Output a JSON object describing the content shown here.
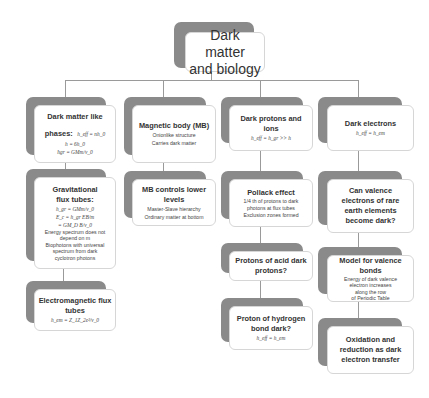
{
  "root": {
    "title_line1": "Dark matter",
    "title_line2": "and biology"
  },
  "columns": [
    {
      "nodes": [
        {
          "title": "Dark matter like",
          "title2": "phases:",
          "formula_inline": "h_eff = nh_0",
          "lines": [
            "h = 6h_0",
            "ħgr = GMm/v_0"
          ]
        },
        {
          "title": "Gravitational",
          "title2": "flux tubes:",
          "formulas": [
            "h_gr = GMm/v_0",
            "E_c = h_gr EB/m",
            "= GM_D B/v_0"
          ],
          "lines": [
            "Energy spectrum does not",
            "depend on m",
            "Biophotons with universal",
            "spectrum from dark",
            "cyclotron photons"
          ]
        },
        {
          "title": "Electromagnetic flux",
          "title2": "tubes",
          "formula": "h_em = Z_1Z_2e²/v_0"
        }
      ]
    },
    {
      "nodes": [
        {
          "title": "Magnetic body (MB)",
          "lines": [
            "Onionlike structure",
            "Carries dark matter"
          ]
        },
        {
          "title": "MB controls lower",
          "title2": "levels",
          "lines": [
            "Master-Slave hierarchy",
            "Ordinary matter at bottom"
          ]
        }
      ]
    },
    {
      "nodes": [
        {
          "title": "Dark protons and",
          "title2": "ions",
          "formula": "h_eff = h_gr >> h"
        },
        {
          "title": "Pollack effect",
          "lines": [
            "1/4 th of protons to dark",
            "photons at flux tubes",
            "Exclusion zones formed"
          ]
        },
        {
          "title": "Protons of acid dark",
          "title2": "protons?"
        },
        {
          "title": "Proton of hydrogen",
          "title2": "bond dark?",
          "formula": "h_eff = h_em"
        }
      ]
    },
    {
      "nodes": [
        {
          "title": "Dark electrons",
          "formula": "h_eff = h_em"
        },
        {
          "title": "Can valence",
          "title2": "electrons of rare",
          "title3": "earth elements",
          "title4": "become dark?"
        },
        {
          "title": "Model for valence",
          "title2": "bonds",
          "lines": [
            "Energy of dark valence",
            "electron increases",
            "along the row",
            "of Periodic Table"
          ]
        },
        {
          "title": "Oxidation and",
          "title2": "reduction as dark",
          "title3": "electron transfer"
        }
      ]
    }
  ],
  "colors": {
    "shadow": "#8a8a8a",
    "card_border": "#d6d6d6",
    "connector": "#9a9a9a",
    "text": "#333333"
  }
}
